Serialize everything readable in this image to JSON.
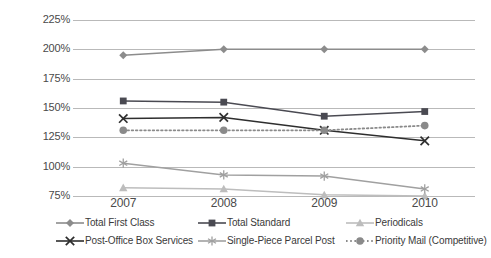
{
  "chart_data": {
    "type": "line",
    "title": "",
    "xlabel": "",
    "ylabel": "",
    "categories": [
      "2007",
      "2008",
      "2009",
      "2010"
    ],
    "x_tick_labels": [
      "2007",
      "2008",
      "2009",
      "2010"
    ],
    "y_tick_labels": [
      "225%",
      "200%",
      "175%",
      "150%",
      "125%",
      "100%",
      "75%"
    ],
    "y_tick_values": [
      225,
      200,
      175,
      150,
      125,
      100,
      75
    ],
    "ylim": [
      75,
      225
    ],
    "grid": true,
    "legend_position": "bottom",
    "series": [
      {
        "name": "Total First Class",
        "marker": "diamond",
        "color": "#8c8c8c",
        "line_style": "solid",
        "values": [
          195,
          200,
          200,
          200
        ]
      },
      {
        "name": "Total Standard",
        "marker": "square",
        "color": "#4a4a52",
        "line_style": "solid",
        "values": [
          156,
          155,
          143,
          147
        ]
      },
      {
        "name": "Periodicals",
        "marker": "triangle",
        "color": "#bdbdbd",
        "line_style": "solid",
        "values": [
          82,
          81,
          76,
          75
        ]
      },
      {
        "name": "Post-Office Box Services",
        "marker": "x",
        "color": "#2e2e2e",
        "line_style": "solid",
        "values": [
          141,
          142,
          131,
          122
        ]
      },
      {
        "name": "Single-Piece Parcel Post",
        "marker": "asterisk",
        "color": "#a0a0a0",
        "line_style": "solid",
        "values": [
          103,
          93,
          92,
          81
        ]
      },
      {
        "name": "Priority Mail (Competitive)",
        "marker": "circle",
        "color": "#8a8a8a",
        "line_style": "dotted",
        "values": [
          131,
          131,
          131,
          135
        ]
      }
    ]
  },
  "legend": {
    "items": [
      {
        "label": "Total First Class",
        "marker": "diamond",
        "color": "#8c8c8c",
        "style": "solid"
      },
      {
        "label": "Total Standard",
        "marker": "square",
        "color": "#4a4a52",
        "style": "solid"
      },
      {
        "label": "Periodicals",
        "marker": "triangle",
        "color": "#bdbdbd",
        "style": "solid"
      },
      {
        "label": "Post-Office Box Services",
        "marker": "x",
        "color": "#2e2e2e",
        "style": "solid"
      },
      {
        "label": "Single-Piece Parcel Post",
        "marker": "asterisk",
        "color": "#a0a0a0",
        "style": "solid"
      },
      {
        "label": "Priority Mail (Competitive)",
        "marker": "circle",
        "color": "#8a8a8a",
        "style": "dotted"
      }
    ]
  },
  "style": {
    "gridline_color": "#b9b9b9",
    "background": "#ffffff",
    "text_color": "#3a3a3a"
  }
}
